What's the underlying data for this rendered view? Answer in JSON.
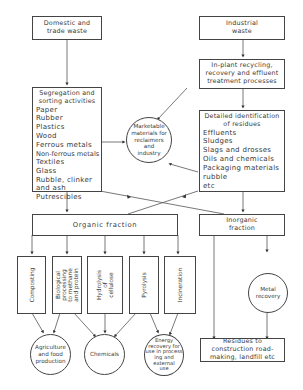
{
  "diagram": {
    "domestic_waste": [
      "Domestic and",
      "trade waste"
    ],
    "industrial_waste": [
      "Industrial",
      "waste"
    ],
    "inplant": [
      "In-plant recycling,",
      "recovery and effluent",
      "treatment processes"
    ],
    "segregation": {
      "title": [
        "Segregation and",
        "sorting activities"
      ],
      "items": [
        "Paper",
        "Rubber",
        "Plastics",
        "Wood",
        "Ferrous metals",
        "Non-ferrous metals",
        "Textiles",
        "Glass",
        "Rubble, clinker",
        "and ash",
        "Putrescibles"
      ]
    },
    "marketable": [
      "Marketable",
      "materials for",
      "reclaimers",
      "and",
      "industry"
    ],
    "residues_id": {
      "title": [
        "Detailed identification",
        "of residues"
      ],
      "items": [
        "Effluents",
        "Sludges",
        "Slags and drosses",
        "Oils and chemicals",
        "Packaging materials",
        "rubble",
        "etc"
      ]
    },
    "organic": "Organic fraction",
    "inorganic": [
      "Inorganic",
      "fraction"
    ],
    "processes": [
      {
        "id": "composting",
        "lines": [
          "Composting"
        ]
      },
      {
        "id": "biological",
        "lines": [
          "Biological",
          "processing",
          "to methane",
          "and protein"
        ]
      },
      {
        "id": "hydrolysis",
        "lines": [
          "Hydrolysis",
          "of",
          "cellulose"
        ]
      },
      {
        "id": "pyrolysis",
        "lines": [
          "Pyrolysis"
        ]
      },
      {
        "id": "incineration",
        "lines": [
          "Incineration"
        ]
      }
    ],
    "outputs": {
      "agriculture": [
        "Agriculture",
        "and food",
        "production"
      ],
      "chemicals": [
        "Chemicals"
      ],
      "energy": [
        "Energy",
        "recovery for",
        "use in process",
        "ing and",
        "external",
        "use"
      ]
    },
    "metal_recovery": [
      "Metal",
      "recovery"
    ],
    "residues_construction": [
      "Residues to",
      "construction road-",
      "making, landfill etc"
    ]
  }
}
